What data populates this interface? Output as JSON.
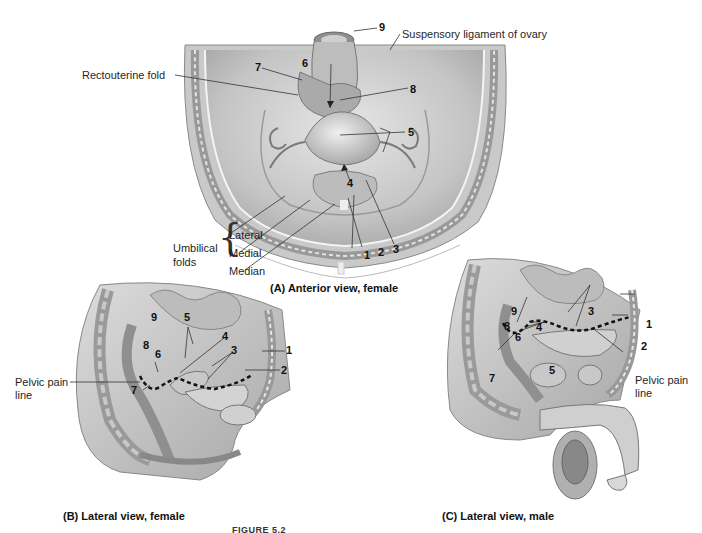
{
  "figure": {
    "caption_partial": "FIGURE 5.2",
    "panels": [
      {
        "id": "A",
        "caption": "(A) Anterior view, female",
        "labels": {
          "suspensory": "Suspensory ligament of ovary",
          "rectouterine": "Rectouterine fold",
          "umbilical": "Umbilical",
          "folds": "folds",
          "lateral": "Lateral",
          "medial": "Medial",
          "median": "Median"
        },
        "numbers": [
          "1",
          "2",
          "3",
          "4",
          "5",
          "6",
          "7",
          "8",
          "9"
        ]
      },
      {
        "id": "B",
        "caption": "(B) Lateral view, female",
        "labels": {
          "pelvic_pain_1": "Pelvic pain",
          "pelvic_pain_2": "line"
        },
        "numbers": [
          "1",
          "2",
          "3",
          "4",
          "5",
          "6",
          "7",
          "8",
          "9"
        ]
      },
      {
        "id": "C",
        "caption": "(C) Lateral view, male",
        "labels": {
          "pelvic_pain_1": "Pelvic pain",
          "pelvic_pain_2": "line"
        },
        "numbers": [
          "1",
          "2",
          "3",
          "4",
          "5",
          "6",
          "7",
          "8",
          "9"
        ]
      }
    ]
  },
  "colors": {
    "tissue_light": "#d9d9d9",
    "tissue_mid": "#b5b5b5",
    "tissue_dark": "#8a8a8a",
    "outline": "#555555",
    "leader": "#333333"
  }
}
